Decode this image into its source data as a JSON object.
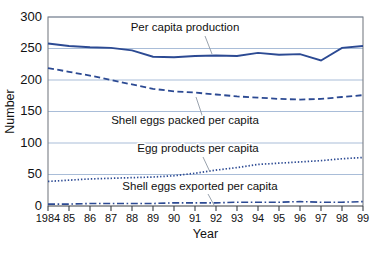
{
  "chart_data": {
    "type": "line",
    "title": "",
    "xlabel": "Year",
    "ylabel": "Number",
    "ylim": [
      0,
      300
    ],
    "yticks": [
      0,
      50,
      100,
      150,
      200,
      250,
      300
    ],
    "ytick_labels": [
      "0",
      "50",
      "100",
      "150",
      "200",
      "250",
      "300"
    ],
    "grid": true,
    "legend_position": "inline-annotations",
    "x": [
      1984,
      1985,
      1986,
      1987,
      1988,
      1989,
      1990,
      1991,
      1992,
      1993,
      1994,
      1995,
      1996,
      1997,
      1998,
      1999
    ],
    "xtick_labels": [
      "1984",
      "85",
      "86",
      "87",
      "88",
      "89",
      "90",
      "91",
      "92",
      "93",
      "94",
      "95",
      "96",
      "97",
      "98",
      "99"
    ],
    "series": [
      {
        "name": "Per capita production",
        "style": "solid",
        "color": "#2c4a93",
        "values": [
          258,
          254,
          252,
          251,
          247,
          237,
          236,
          238,
          239,
          238,
          243,
          240,
          241,
          231,
          251,
          254
        ]
      },
      {
        "name": "Shell eggs packed per capita",
        "style": "dashed",
        "color": "#2c4a93",
        "values": [
          219,
          213,
          207,
          200,
          193,
          186,
          182,
          180,
          177,
          174,
          172,
          170,
          169,
          170,
          173,
          176
        ]
      },
      {
        "name": "Egg products per capita",
        "style": "dotted",
        "color": "#2c4a93",
        "values": [
          39,
          41,
          43,
          44,
          45,
          46,
          48,
          52,
          57,
          61,
          66,
          68,
          70,
          72,
          75,
          77
        ]
      },
      {
        "name": "Shell eggs exported per capita",
        "style": "dashdot",
        "color": "#2c4a93",
        "values": [
          3,
          3,
          4,
          4,
          4,
          4,
          5,
          5,
          5,
          6,
          6,
          6,
          7,
          6,
          6,
          7
        ]
      }
    ],
    "annotations": [
      {
        "text": "Per capita production",
        "label_x": 185,
        "label_y": 31,
        "leader_from_x": 205,
        "leader_from_y": 36,
        "leader_to_x": 212,
        "leader_to_y": 54
      },
      {
        "text": "Shell eggs packed per capita",
        "label_x": 185,
        "label_y": 124,
        "leader_from_x": 203,
        "leader_from_y": 118,
        "leader_to_x": 196,
        "leader_to_y": 97
      },
      {
        "text": "Egg products per capita",
        "label_x": 198,
        "label_y": 152,
        "leader_from_x": 203,
        "leader_from_y": 157,
        "leader_to_x": 210,
        "leader_to_y": 172
      },
      {
        "text": "Shell eggs exported per capita",
        "label_x": 200,
        "label_y": 190,
        "leader_from_x": 208,
        "leader_from_y": 194,
        "leader_to_x": 214,
        "leader_to_y": 205
      }
    ]
  }
}
